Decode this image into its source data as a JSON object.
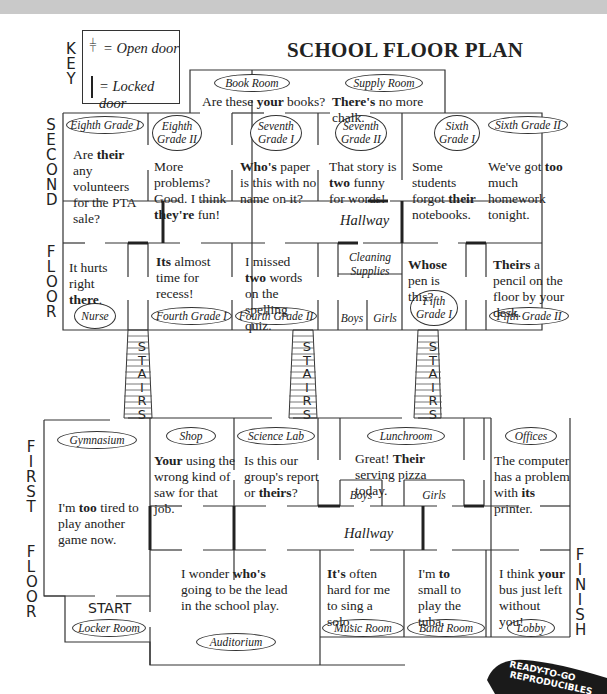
{
  "header": {
    "title": "SCHOOL FLOOR PLAN"
  },
  "key": {
    "label": "KEY",
    "open_door": "= Open door",
    "locked_door": "= Locked door"
  },
  "floor_labels": {
    "second": [
      "SECOND",
      "FLOOR"
    ],
    "first": [
      "FIRST",
      "FLOOR"
    ],
    "stairs": "STAIRS",
    "start": "START",
    "finish": "FINISH"
  },
  "second_floor": {
    "hallway": "Hallway",
    "rooms": [
      {
        "name": "Book Room",
        "sentence": [
          "Are these ",
          "your",
          " books?"
        ]
      },
      {
        "name": "Supply Room",
        "sentence": [
          "",
          "There's",
          " no more chalk."
        ]
      },
      {
        "name": "Eighth Grade I",
        "sentence": [
          "Are ",
          "their",
          " any volunteers for the PTA sale?"
        ]
      },
      {
        "name": "Eighth Grade II",
        "sentence": [
          "More problems? Good. I think ",
          "they're",
          " fun!"
        ]
      },
      {
        "name": "Seventh Grade I",
        "sentence": [
          "",
          "Who's",
          " paper is this with no name on it?"
        ]
      },
      {
        "name": "Seventh Grade II",
        "sentence": [
          "That story is ",
          "two",
          " funny for words!"
        ]
      },
      {
        "name": "Sixth Grade I",
        "sentence": [
          "Some students forgot ",
          "their",
          " notebooks."
        ]
      },
      {
        "name": "Sixth Grade II",
        "sentence": [
          "We've got ",
          "too",
          " much homework tonight."
        ]
      },
      {
        "name": "Nurse",
        "sentence": [
          "It hurts right ",
          "there",
          "."
        ]
      },
      {
        "name": "Fourth Grade I",
        "sentence": [
          "",
          "Its",
          " almost time for recess!"
        ]
      },
      {
        "name": "Fourth Grade II",
        "sentence": [
          "I missed ",
          "two",
          " words on the spelling quiz."
        ]
      },
      {
        "name": "Cleaning Supplies",
        "sentence": null
      },
      {
        "name": "Boys",
        "sentence": null
      },
      {
        "name": "Girls",
        "sentence": null
      },
      {
        "name": "Fifth Grade I",
        "sentence": [
          "",
          "Whose",
          " pen is this?"
        ]
      },
      {
        "name": "Fifth Grade II",
        "sentence": [
          "",
          "Theirs",
          " a pencil on the floor by your desk."
        ]
      }
    ]
  },
  "first_floor": {
    "hallway": "Hallway",
    "rooms": [
      {
        "name": "Gymnasium",
        "sentence": [
          "I'm ",
          "too",
          " tired to play another game now."
        ]
      },
      {
        "name": "Shop",
        "sentence": [
          "",
          "Your",
          " using the wrong kind of saw for that job."
        ]
      },
      {
        "name": "Science Lab",
        "sentence": [
          "Is this our group's report or ",
          "theirs",
          "?"
        ]
      },
      {
        "name": "Lunchroom",
        "sentence": [
          "Great!  ",
          "Their",
          " serving pizza today."
        ]
      },
      {
        "name": "Offices",
        "sentence": [
          "The computer has a problem with ",
          "its",
          " printer."
        ]
      },
      {
        "name": "Boys",
        "sentence": null
      },
      {
        "name": "Girls",
        "sentence": null
      },
      {
        "name": "Auditorium",
        "sentence": [
          "I wonder ",
          "who's",
          " going to be the lead in the school play."
        ]
      },
      {
        "name": "Music Room",
        "sentence": [
          "",
          "It's",
          " often hard for me to sing a solo."
        ]
      },
      {
        "name": "Band Room",
        "sentence": [
          "I'm ",
          "to",
          " small to play the tuba."
        ]
      },
      {
        "name": "Lobby",
        "sentence": [
          "I think ",
          "your",
          " bus just left without you!"
        ]
      },
      {
        "name": "Locker Room",
        "sentence": null
      }
    ]
  },
  "badge": {
    "line1": "READY-TO-GO",
    "line2": "REPRODUCIBLES"
  },
  "colors": {
    "ink": "#222222",
    "topbar": "#c9c9c9",
    "background": "#ffffff"
  }
}
